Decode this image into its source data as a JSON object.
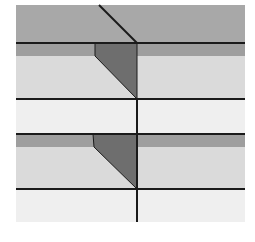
{
  "diagram": {
    "width": 255,
    "height": 242,
    "colors": {
      "background": "#ffffff",
      "top_band": "#a8a8a8",
      "strip": "#9e9e9e",
      "light": "#dadada",
      "very_light": "#efefef",
      "wedge": "#6e6e6e",
      "line": "#1a1a1a"
    },
    "regions": [
      {
        "name": "top-band",
        "x": 16,
        "y": 5,
        "w": 229,
        "h": 38,
        "fill": "top_band"
      },
      {
        "name": "strip-1",
        "x": 16,
        "y": 43,
        "w": 229,
        "h": 13,
        "fill": "strip"
      },
      {
        "name": "light-1",
        "x": 16,
        "y": 56,
        "w": 229,
        "h": 43,
        "fill": "light"
      },
      {
        "name": "very-light-1",
        "x": 16,
        "y": 99,
        "w": 229,
        "h": 35,
        "fill": "very_light"
      },
      {
        "name": "strip-2",
        "x": 16,
        "y": 134,
        "w": 229,
        "h": 13,
        "fill": "strip"
      },
      {
        "name": "light-2",
        "x": 16,
        "y": 147,
        "w": 229,
        "h": 42,
        "fill": "light"
      },
      {
        "name": "very-light-2",
        "x": 16,
        "y": 189,
        "w": 229,
        "h": 33,
        "fill": "very_light"
      }
    ],
    "wedges": [
      {
        "name": "wedge-1",
        "points": "95,43 137,43 137,99 95,56"
      },
      {
        "name": "wedge-2",
        "points": "93,134 137,134 137,189 94,147"
      }
    ],
    "lines": [
      {
        "name": "diagonal-top",
        "x1": 99,
        "y1": 5,
        "x2": 137,
        "y2": 43
      },
      {
        "name": "hline-1",
        "x1": 16,
        "y1": 43,
        "x2": 245,
        "y2": 43
      },
      {
        "name": "hline-2",
        "x1": 16,
        "y1": 99,
        "x2": 245,
        "y2": 99
      },
      {
        "name": "hline-3",
        "x1": 16,
        "y1": 134,
        "x2": 245,
        "y2": 134
      },
      {
        "name": "hline-4",
        "x1": 16,
        "y1": 189,
        "x2": 245,
        "y2": 189
      },
      {
        "name": "vline",
        "x1": 137,
        "y1": 99,
        "x2": 137,
        "y2": 222
      }
    ]
  }
}
